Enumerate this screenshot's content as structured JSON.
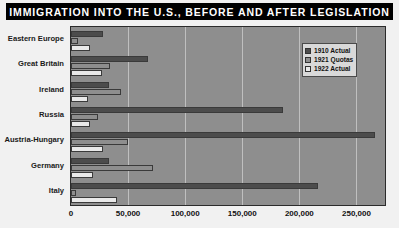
{
  "title": "IMMIGRATION INTO THE U.S., BEFORE AND AFTER LEGISLATION",
  "legend": {
    "items": [
      {
        "label": "1910 Actual",
        "color": "#4c4c4c"
      },
      {
        "label": "1921 Quotas",
        "color": "#8e8e8e"
      },
      {
        "label": "1922 Actual",
        "color": "#e9e9e9"
      }
    ]
  },
  "chart_data": {
    "type": "bar",
    "orientation": "horizontal",
    "title": "IMMIGRATION INTO THE U.S., BEFORE AND AFTER LEGISLATION",
    "xlabel": "",
    "ylabel": "",
    "xlim": [
      0,
      275000
    ],
    "ticks": [
      0,
      50000,
      100000,
      150000,
      200000,
      250000
    ],
    "tick_labels": [
      "0",
      "50,000",
      "100,000",
      "150,000",
      "200,000",
      "250,000"
    ],
    "grid": true,
    "legend_position": "top-right",
    "categories": [
      "Eastern Europe",
      "Great Britain",
      "Ireland",
      "Russia",
      "Austria-Hungary",
      "Germany",
      "Italy"
    ],
    "series": [
      {
        "name": "1910 Actual",
        "color": "#4c4c4c",
        "values": [
          28000,
          67000,
          33000,
          186000,
          266000,
          33000,
          216000
        ]
      },
      {
        "name": "1921 Quotas",
        "color": "#8e8e8e",
        "values": [
          6000,
          34000,
          44000,
          24000,
          50000,
          72000,
          4000
        ]
      },
      {
        "name": "1922 Actual",
        "color": "#e9e9e9",
        "values": [
          17000,
          27000,
          15000,
          17000,
          28000,
          19000,
          40000
        ]
      }
    ]
  }
}
